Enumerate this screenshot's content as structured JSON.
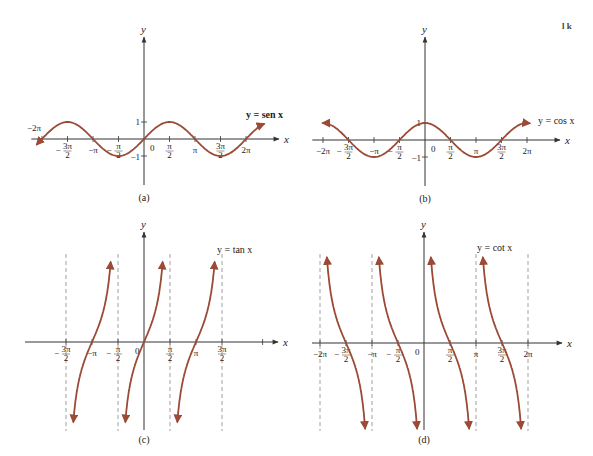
{
  "page": {
    "corner_mark": "l k",
    "curve_color": "#9b4a35",
    "axis_color": "#333333"
  },
  "chart_data": [
    {
      "id": "a",
      "type": "line",
      "caption": "(a)",
      "title": "y = sen x",
      "function": "sin",
      "xlabel": "x",
      "ylabel": "y",
      "x_ticks": [
        "−2π",
        "−3π/2",
        "−π",
        "−π/2",
        "0",
        "π/2",
        "π",
        "3π/2",
        "2π"
      ],
      "y_ticks": [
        "1",
        "−1"
      ],
      "xlim": [
        "−2.1π",
        "2.4π"
      ],
      "ylim": [
        -1,
        1
      ],
      "points": [
        {
          "x": "−2π",
          "y": 0
        },
        {
          "x": "−3π/2",
          "y": 1
        },
        {
          "x": "−π",
          "y": 0
        },
        {
          "x": "−π/2",
          "y": -1
        },
        {
          "x": "0",
          "y": 0
        },
        {
          "x": "π/2",
          "y": 1
        },
        {
          "x": "π",
          "y": 0
        },
        {
          "x": "3π/2",
          "y": -1
        },
        {
          "x": "2π",
          "y": 0
        }
      ],
      "arrows_at_ends": true,
      "grid": false
    },
    {
      "id": "b",
      "type": "line",
      "caption": "(b)",
      "title": "y = cos x",
      "function": "cos",
      "xlabel": "x",
      "ylabel": "y",
      "x_ticks": [
        "−2π",
        "−3π/2",
        "−π",
        "−π/2",
        "0",
        "π/2",
        "π",
        "3π/2",
        "2π"
      ],
      "y_ticks": [
        "1",
        "−1"
      ],
      "xlim": [
        "−2π",
        "2π"
      ],
      "ylim": [
        -1,
        1
      ],
      "points": [
        {
          "x": "−2π",
          "y": 1
        },
        {
          "x": "−3π/2",
          "y": 0
        },
        {
          "x": "−π",
          "y": -1
        },
        {
          "x": "−π/2",
          "y": 0
        },
        {
          "x": "0",
          "y": 1
        },
        {
          "x": "π/2",
          "y": 0
        },
        {
          "x": "π",
          "y": -1
        },
        {
          "x": "3π/2",
          "y": 0
        },
        {
          "x": "2π",
          "y": 1
        }
      ],
      "arrows_at_ends": true,
      "grid": false
    },
    {
      "id": "c",
      "type": "line",
      "caption": "(c)",
      "title": "y = tan x",
      "function": "tan",
      "xlabel": "x",
      "ylabel": "y",
      "x_ticks": [
        "−3π/2",
        "−π",
        "−π/2",
        "0",
        "π/2",
        "π",
        "3π/2"
      ],
      "asymptotes": [
        "−3π/2",
        "−π/2",
        "π/2",
        "3π/2"
      ],
      "zeros": [
        "−π",
        "0",
        "π"
      ],
      "branches": 3,
      "grid": false
    },
    {
      "id": "d",
      "type": "line",
      "caption": "(d)",
      "title": "y = cot x",
      "function": "cot",
      "xlabel": "x",
      "ylabel": "y",
      "x_ticks": [
        "−2π",
        "−3π/2",
        "−π",
        "−π/2",
        "0",
        "π/2",
        "π",
        "3π/2",
        "2π"
      ],
      "asymptotes": [
        "−2π",
        "−π",
        "0",
        "π",
        "2π"
      ],
      "zeros": [
        "−3π/2",
        "−π/2",
        "π/2",
        "3π/2"
      ],
      "branches": 4,
      "grid": false
    }
  ]
}
